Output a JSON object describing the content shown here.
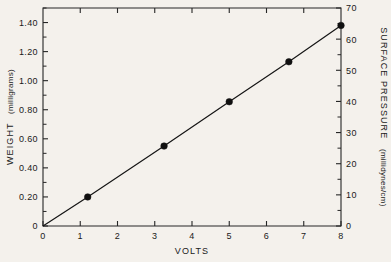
{
  "chart_data": {
    "type": "line",
    "title": "",
    "xlabel": "VOLTS",
    "ylabel": "WEIGHT  (milligrams)",
    "y2label": "SURFACE  PRESSURE  (millidynes/cm)",
    "xlim": [
      0,
      8
    ],
    "ylim": [
      0,
      1.5
    ],
    "y2lim": [
      0,
      70
    ],
    "grid": false,
    "legend": null,
    "x_ticks": [
      0,
      1,
      2,
      3,
      4,
      5,
      6,
      7,
      8
    ],
    "x_tick_labels": [
      "0",
      "1",
      "2",
      "3",
      "4",
      "5",
      "6",
      "7",
      "8"
    ],
    "y_ticks": [
      0,
      0.2,
      0.4,
      0.6,
      0.8,
      1.0,
      1.2,
      1.4
    ],
    "y_tick_labels": [
      "0",
      "0.20",
      "0.40",
      "0.60",
      "0.80",
      "1.00",
      "1.20",
      "1.40"
    ],
    "y_minor_ticks": [
      0.1,
      0.3,
      0.5,
      0.7,
      0.9,
      1.1,
      1.3,
      1.5
    ],
    "y2_ticks": [
      0,
      10,
      20,
      30,
      40,
      50,
      60,
      70
    ],
    "y2_tick_labels": [
      "0",
      "10",
      "20",
      "30",
      "40",
      "50",
      "60",
      "70"
    ],
    "y2_minor_ticks": [
      5,
      15,
      25,
      35,
      45,
      55,
      65
    ],
    "top_ticks": [
      1,
      2,
      3,
      4,
      5,
      6,
      7
    ],
    "series": [
      {
        "name": "weight vs volts",
        "x": [
          0,
          1.2,
          3.25,
          5.0,
          6.6,
          8.0
        ],
        "y": [
          0,
          0.2,
          0.55,
          0.855,
          1.13,
          1.38
        ],
        "markers_at": [
          1.2,
          3.25,
          5.0,
          6.6,
          8.0
        ],
        "marker": "filled-circle",
        "color": "#101010"
      }
    ]
  },
  "figure": {
    "background_color": "#f4f1ec",
    "axis_color": "#262626",
    "x_axis_title": "VOLTS",
    "left_axis_title_main": "WEIGHT",
    "left_axis_title_unit": "(milligrams)",
    "right_axis_title_main": "SURFACE   PRESSURE",
    "right_axis_title_unit": "(millidynes/cm)"
  }
}
